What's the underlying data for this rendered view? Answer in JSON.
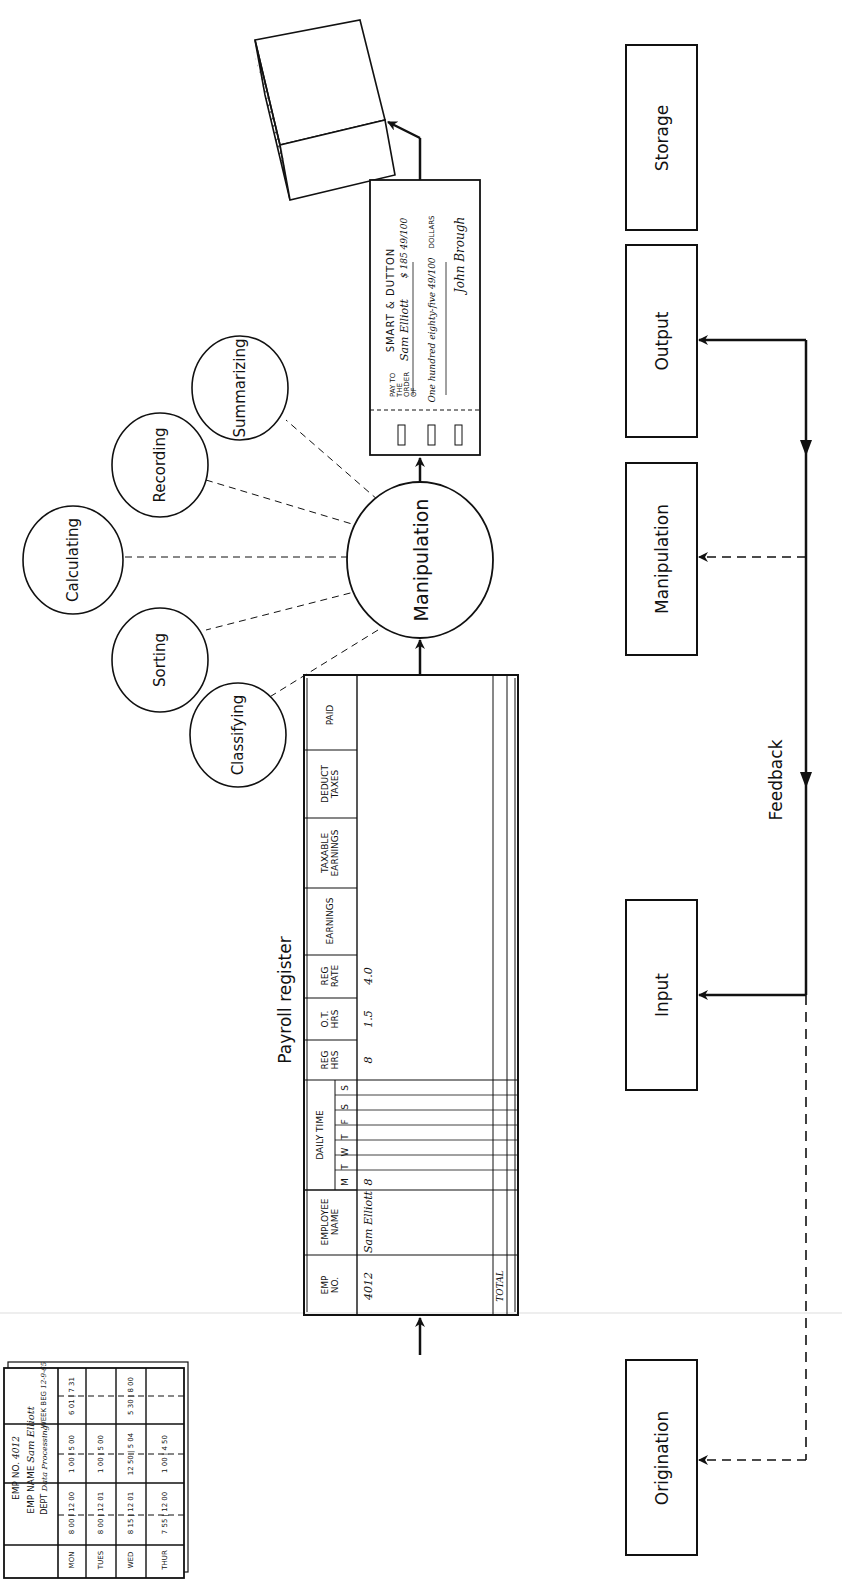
{
  "process_boxes": {
    "storage": "Storage",
    "output": "Output",
    "manipulation": "Manipulation",
    "input": "Input",
    "origination": "Origination"
  },
  "feedback_label": "Feedback",
  "manipulation_circle": "Manipulation",
  "operations": [
    "Classifying",
    "Sorting",
    "Calculating",
    "Recording",
    "Summarizing"
  ],
  "payroll_register": {
    "title": "Payroll register",
    "headers": {
      "emp_no": "EMP NO.",
      "employee_name": "EMPLOYEE NAME",
      "daily_time": "DAILY TIME",
      "days": [
        "M",
        "T",
        "W",
        "T",
        "F",
        "S",
        "S"
      ],
      "reg_hrs": "REG HRS",
      "ot_hrs": "O.T. HRS",
      "reg_rate": "REG RATE",
      "earnings": "EARNINGS",
      "taxable_earnings": "TAXABLE EARNINGS",
      "deduct_taxes": "DEDUCT TAXES",
      "paid": "PAID"
    },
    "row": {
      "emp_no": "4012",
      "employee_name": "Sam Elliott",
      "mon": "8",
      "reg_hrs": "8",
      "ot_hrs": "1.5",
      "reg_rate": "4.0"
    },
    "total_label": "TOTAL"
  },
  "time_card": {
    "emp_no_label": "EMP NO.",
    "emp_no": "4012",
    "emp_name_label": "EMP NAME",
    "emp_name": "Sam Elliott",
    "dept_label": "DEPT",
    "dept": "Data Processing",
    "week_label": "WEEK BEG",
    "week": "12-9-65",
    "col_labels": [
      "AM",
      "PM",
      "EVE"
    ],
    "days": [
      {
        "day": "MON",
        "am": "8 00 | 12 00",
        "pm": "1 00 | 5 00",
        "eve": "6 01 | 7 31"
      },
      {
        "day": "TUES",
        "am": "8 00 | 12 01",
        "pm": "1 00 | 5 00",
        "eve": ""
      },
      {
        "day": "WED",
        "am": "8 15 | 12 01",
        "pm": "12 50 | 5 04",
        "eve": "5 30 | 8 00"
      },
      {
        "day": "THUR",
        "am": "7 55 | 12 00",
        "pm": "1 00 | 4 50",
        "eve": ""
      },
      {
        "day": "FRI",
        "am": "8 00 | 12 10",
        "pm": "12 55 | 5 00",
        "eve": "6 13 | 7 43"
      },
      {
        "day": "SAT",
        "am": "8 00 | 12 30",
        "pm": "",
        "eve": ""
      },
      {
        "day": "SUN",
        "am": "",
        "pm": "",
        "eve": ""
      }
    ]
  },
  "check": {
    "company": "SMART & DUTTON",
    "pay_to_label": "PAY TO THE ORDER OF",
    "payee": "Sam Elliott",
    "amount": "$ 185 49/100",
    "amount_words": "One hundred eighty-five 49/100",
    "dollars_label": "DOLLARS",
    "signature": "John Brough"
  },
  "storage_icon": "card-file-stack"
}
